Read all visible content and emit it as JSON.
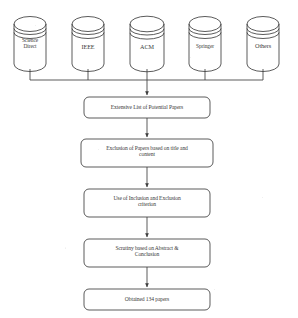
{
  "diagram": {
    "stroke_color": "#3d3d3d",
    "text_color": "#3a3a3a",
    "background_color": "#ffffff"
  },
  "sources": [
    {
      "label": "Science\nDirect",
      "name": "science-direct"
    },
    {
      "label": "IEEE",
      "name": "ieee"
    },
    {
      "label": "ACM",
      "name": "acm"
    },
    {
      "label": "Springer",
      "name": "springer"
    },
    {
      "label": "Others",
      "name": "others"
    }
  ],
  "steps": [
    {
      "label": "Extensive List of Potential Papers",
      "name": "extensive-list"
    },
    {
      "label": "Exclusion of Papers based on title and\ncontent",
      "name": "exclusion-title-content"
    },
    {
      "label": "Use of Inclusion and Exclusion\ncriterion",
      "name": "inclusion-exclusion-criterion"
    },
    {
      "label": "Scrutiny based on Abstract &\nConclusion",
      "name": "scrutiny-abstract-conclusion"
    },
    {
      "label": "Obtained 134 papers",
      "name": "obtained-papers"
    }
  ],
  "result": {
    "count": "134",
    "unit": "papers"
  }
}
